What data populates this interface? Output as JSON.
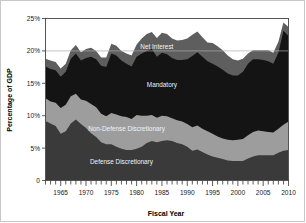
{
  "chart_data": {
    "type": "area",
    "stacked": true,
    "title": "",
    "subtitle": "",
    "xlabel": "Fiscal Year",
    "ylabel": "Percentage of GDP",
    "xlim": [
      1962,
      2010
    ],
    "ylim": [
      0,
      25
    ],
    "grid": "horizontal gridline at 20% only",
    "legend_position": "inline labels on bands",
    "y_ticks": [
      0,
      5,
      10,
      15,
      20,
      25
    ],
    "y_ticklabels": [
      "0",
      "5%",
      "10%",
      "15%",
      "20%",
      "25%"
    ],
    "x_ticks": [
      1965,
      1970,
      1975,
      1980,
      1985,
      1990,
      1995,
      2000,
      2005,
      2010
    ],
    "x_ticklabels": [
      "1965",
      "1970",
      "1975",
      "1980",
      "1985",
      "1990",
      "1995",
      "2000",
      "2005",
      "2010"
    ],
    "x_minor_tick_interval": 1,
    "x": [
      1962,
      1963,
      1964,
      1965,
      1966,
      1967,
      1968,
      1969,
      1970,
      1971,
      1972,
      1973,
      1974,
      1975,
      1976,
      1977,
      1978,
      1979,
      1980,
      1981,
      1982,
      1983,
      1984,
      1985,
      1986,
      1987,
      1988,
      1989,
      1990,
      1991,
      1992,
      1993,
      1994,
      1995,
      1996,
      1997,
      1998,
      1999,
      2000,
      2001,
      2002,
      2003,
      2004,
      2005,
      2006,
      2007,
      2008,
      2009,
      2010
    ],
    "series": [
      {
        "name": "Defense Discretionary",
        "color": "#3a3a3a",
        "label_x": 1977,
        "label_y": 2.6,
        "label_color": "light",
        "values": [
          9.2,
          8.8,
          8.4,
          7.2,
          7.6,
          8.8,
          9.4,
          8.7,
          8.1,
          7.3,
          6.7,
          5.9,
          5.6,
          5.6,
          5.2,
          4.9,
          4.7,
          4.7,
          4.9,
          5.2,
          5.8,
          6.1,
          5.9,
          6.1,
          6.2,
          6.1,
          5.8,
          5.6,
          5.2,
          4.6,
          4.8,
          4.4,
          4.0,
          3.7,
          3.5,
          3.3,
          3.1,
          3.0,
          3.0,
          3.0,
          3.4,
          3.7,
          3.9,
          3.9,
          3.9,
          3.9,
          4.3,
          4.6,
          4.7
        ]
      },
      {
        "name": "Non-Defense Discretionary",
        "color": "#9d9d9d",
        "label_x": 1978,
        "label_y": 7.6,
        "label_color": "light",
        "values": [
          3.5,
          3.4,
          3.6,
          4.0,
          4.1,
          4.2,
          4.0,
          3.8,
          4.2,
          4.5,
          4.6,
          4.4,
          4.3,
          4.8,
          5.0,
          5.0,
          5.1,
          4.8,
          5.2,
          4.8,
          4.2,
          4.0,
          3.8,
          3.9,
          3.7,
          3.5,
          3.5,
          3.5,
          3.5,
          3.6,
          3.7,
          3.6,
          3.6,
          3.5,
          3.3,
          3.2,
          3.2,
          3.2,
          3.3,
          3.4,
          3.6,
          3.8,
          3.8,
          3.7,
          3.6,
          3.5,
          3.7,
          4.0,
          4.4
        ]
      },
      {
        "name": "Mandatory",
        "color": "#141414",
        "label_x": 1985,
        "label_y": 14.5,
        "label_color": "light",
        "values": [
          4.9,
          5.0,
          5.0,
          4.8,
          5.1,
          5.8,
          6.2,
          6.0,
          6.6,
          7.3,
          7.4,
          7.4,
          7.6,
          9.2,
          9.1,
          8.6,
          8.2,
          8.1,
          9.0,
          9.6,
          10.0,
          10.2,
          9.4,
          9.7,
          9.6,
          9.3,
          9.3,
          9.5,
          10.0,
          11.0,
          11.3,
          11.1,
          10.8,
          10.8,
          10.8,
          10.6,
          10.2,
          10.0,
          9.9,
          10.4,
          11.0,
          11.2,
          11.0,
          11.0,
          10.9,
          10.6,
          11.7,
          14.5,
          13.2
        ]
      },
      {
        "name": "Net Interest",
        "color": "#5e5e5e",
        "label_x": 1984,
        "label_y": 20.3,
        "label_color": "light",
        "values": [
          1.2,
          1.3,
          1.3,
          1.3,
          1.2,
          1.3,
          1.3,
          1.3,
          1.4,
          1.4,
          1.3,
          1.3,
          1.5,
          1.5,
          1.5,
          1.5,
          1.6,
          1.7,
          1.9,
          2.3,
          2.6,
          2.6,
          2.9,
          3.1,
          3.1,
          3.0,
          3.0,
          3.1,
          3.2,
          3.3,
          3.2,
          3.0,
          2.9,
          3.2,
          3.1,
          3.0,
          2.8,
          2.5,
          2.3,
          2.0,
          1.6,
          1.4,
          1.4,
          1.5,
          1.7,
          1.7,
          1.7,
          1.3,
          1.4
        ]
      }
    ]
  }
}
